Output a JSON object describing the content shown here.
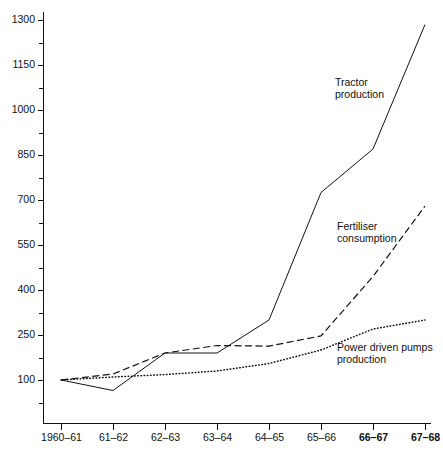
{
  "chart_data": {
    "type": "line",
    "title": "",
    "subtitle": "",
    "xlabel": "",
    "ylabel": "",
    "grid": false,
    "legend_position": "inline-annotations",
    "categories": [
      "1960–61",
      "61–62",
      "62–63",
      "63–64",
      "64–65",
      "65–66",
      "66–67",
      "67–68"
    ],
    "x_tick_labels": [
      "1960–61",
      "61–62",
      "62–63",
      "63–64",
      "64–65",
      "65–66",
      "66–67",
      "67–68"
    ],
    "x_tick_bold": [
      false,
      false,
      false,
      false,
      false,
      false,
      true,
      true
    ],
    "y_tick_labels": [
      "100",
      "250",
      "400",
      "550",
      "700",
      "850",
      "1000",
      "1150",
      "1300"
    ],
    "y_tick_values": [
      100,
      250,
      400,
      550,
      700,
      850,
      1000,
      1150,
      1300
    ],
    "y_minor_tick_values": [
      25,
      175,
      325,
      475,
      625,
      775,
      925,
      1075,
      1225
    ],
    "ylim": [
      25,
      1300
    ],
    "series": [
      {
        "name": "Tractor production",
        "style": "solid",
        "values": [
          100,
          65,
          190,
          190,
          300,
          725,
          870,
          1285
        ],
        "label_lines": [
          "Tractor",
          "production"
        ]
      },
      {
        "name": "Fertiliser consumption",
        "style": "dashed",
        "values": [
          100,
          120,
          190,
          215,
          213,
          247,
          445,
          680
        ],
        "label_lines": [
          "Fertiliser",
          "consumption"
        ]
      },
      {
        "name": "Power driven pumps production",
        "style": "dotted",
        "values": [
          100,
          110,
          118,
          130,
          155,
          200,
          270,
          300
        ],
        "label_lines": [
          "Power driven pumps",
          "production"
        ]
      }
    ],
    "annotations": [
      {
        "text": "Tractor production",
        "lines": [
          "Tractor",
          "production"
        ],
        "x": 335,
        "y": 86
      },
      {
        "text": "Fertiliser consumption",
        "lines": [
          "Fertiliser",
          "consumption"
        ],
        "x": 337,
        "y": 230
      },
      {
        "text": "Power driven pumps production",
        "lines": [
          "Power driven pumps",
          "production"
        ],
        "x": 337,
        "y": 351
      }
    ],
    "colors": {
      "axis": "#111111",
      "series_tractor": "#111111",
      "series_fertiliser": "#111111",
      "series_pumps": "#111111",
      "background": "#ffffff"
    }
  }
}
